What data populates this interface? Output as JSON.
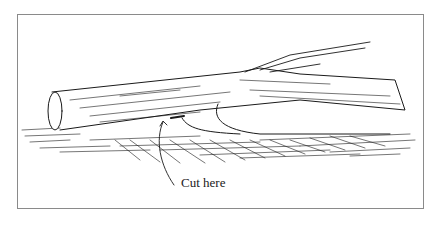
{
  "figure": {
    "callout_label": "Cut here",
    "frame_color": "#8a8a8a",
    "ink_color": "#1a1a1a"
  }
}
